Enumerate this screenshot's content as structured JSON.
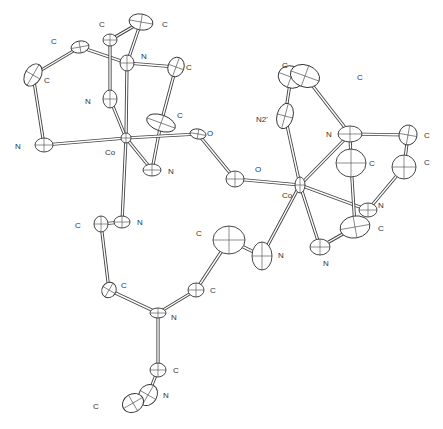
{
  "figure": {
    "type": "ORTEP thermal-ellipsoid diagram"
  },
  "atoms": [
    {
      "id": "c1",
      "el": "C",
      "label": "C",
      "x": 80,
      "y": 47,
      "rx": 9,
      "ry": 6,
      "rot": -10,
      "lx": 51,
      "ly": 44
    },
    {
      "id": "c2",
      "el": "C",
      "label": "C",
      "x": 110,
      "y": 40,
      "rx": 7,
      "ry": 6,
      "rot": 0,
      "lx": 99,
      "ly": 27
    },
    {
      "id": "c3",
      "el": "C",
      "label": "C",
      "x": 141,
      "y": 22,
      "rx": 12,
      "ry": 8,
      "rot": 10,
      "lx": 162,
      "ly": 27
    },
    {
      "id": "c4",
      "el": "C",
      "label": "C",
      "x": 33,
      "y": 75,
      "rx": 8,
      "ry": 12,
      "rot": 30,
      "lx": 44,
      "ly": 83
    },
    {
      "id": "n1",
      "el": "N",
      "label": "N",
      "x": 127,
      "y": 63,
      "rx": 7,
      "ry": 8,
      "rot": 0,
      "lx": 141,
      "ly": 59
    },
    {
      "id": "c5",
      "el": "C",
      "label": "C",
      "x": 176,
      "y": 67,
      "rx": 8,
      "ry": 10,
      "rot": 20,
      "lx": 186,
      "ly": 70
    },
    {
      "id": "n2",
      "el": "N",
      "label": "N",
      "x": 110,
      "y": 99,
      "rx": 7,
      "ry": 9,
      "rot": 0,
      "lx": 85,
      "ly": 104
    },
    {
      "id": "c6",
      "el": "C",
      "label": "C",
      "x": 161,
      "y": 123,
      "rx": 15,
      "ry": 8,
      "rot": 20,
      "lx": 177,
      "ly": 118
    },
    {
      "id": "n3",
      "el": "N",
      "label": "N",
      "x": 44,
      "y": 145,
      "rx": 9,
      "ry": 7,
      "rot": 0,
      "lx": 15,
      "ly": 149
    },
    {
      "id": "co1",
      "el": "Co",
      "label": "Co",
      "x": 126,
      "y": 138,
      "rx": 5,
      "ry": 5,
      "rot": 0,
      "lx": 105,
      "ly": 155
    },
    {
      "id": "o1",
      "el": "O",
      "label": "O",
      "x": 198,
      "y": 134,
      "rx": 8,
      "ry": 5,
      "rot": 10,
      "lx": 207,
      "ly": 136
    },
    {
      "id": "n4",
      "el": "N",
      "label": "N",
      "x": 152,
      "y": 170,
      "rx": 9,
      "ry": 6,
      "rot": 0,
      "lx": 168,
      "ly": 174
    },
    {
      "id": "o2",
      "el": "O",
      "label": "O",
      "x": 235,
      "y": 179,
      "rx": 9,
      "ry": 8,
      "rot": 0,
      "lx": 255,
      "ly": 172
    },
    {
      "id": "c7",
      "el": "C",
      "label": "C",
      "x": 291,
      "y": 77,
      "rx": 13,
      "ry": 11,
      "rot": 20,
      "lx": 282,
      "ly": 68
    },
    {
      "id": "c8",
      "el": "C",
      "label": "C",
      "x": 305,
      "y": 76,
      "rx": 15,
      "ry": 11,
      "rot": 20,
      "lx": 357,
      "ly": 80
    },
    {
      "id": "n5",
      "el": "N",
      "label": "N2'",
      "x": 285,
      "y": 116,
      "rx": 8,
      "ry": 13,
      "rot": 15,
      "lx": 256,
      "ly": 122
    },
    {
      "id": "n6",
      "el": "N",
      "label": "N",
      "x": 350,
      "y": 134,
      "rx": 12,
      "ry": 8,
      "rot": 0,
      "lx": 326,
      "ly": 137
    },
    {
      "id": "c9",
      "el": "C",
      "label": "C",
      "x": 408,
      "y": 135,
      "rx": 9,
      "ry": 10,
      "rot": 10,
      "lx": 424,
      "ly": 138
    },
    {
      "id": "c10",
      "el": "C",
      "label": "C",
      "x": 351,
      "y": 163,
      "rx": 15,
      "ry": 14,
      "rot": 0,
      "lx": 369,
      "ly": 166
    },
    {
      "id": "c11",
      "el": "C",
      "label": "C",
      "x": 404,
      "y": 167,
      "rx": 12,
      "ry": 12,
      "rot": 0,
      "lx": 424,
      "ly": 165
    },
    {
      "id": "co2",
      "el": "Co",
      "label": "Co",
      "x": 300,
      "y": 185,
      "rx": 5,
      "ry": 8,
      "rot": 0,
      "lx": 282,
      "ly": 198
    },
    {
      "id": "n7",
      "el": "N",
      "label": "N",
      "x": 368,
      "y": 210,
      "rx": 9,
      "ry": 7,
      "rot": 0,
      "lx": 378,
      "ly": 208
    },
    {
      "id": "c12",
      "el": "C",
      "label": "C",
      "x": 355,
      "y": 227,
      "rx": 15,
      "ry": 11,
      "rot": -10,
      "lx": 378,
      "ly": 231
    },
    {
      "id": "n8",
      "el": "N",
      "label": "N",
      "x": 320,
      "y": 247,
      "rx": 10,
      "ry": 8,
      "rot": 0,
      "lx": 323,
      "ly": 266
    },
    {
      "id": "n9",
      "el": "N",
      "label": "N",
      "x": 262,
      "y": 256,
      "rx": 10,
      "ry": 14,
      "rot": 0,
      "lx": 278,
      "ly": 258
    },
    {
      "id": "c13",
      "el": "C",
      "label": "C",
      "x": 229,
      "y": 240,
      "rx": 16,
      "ry": 14,
      "rot": 0,
      "lx": 196,
      "ly": 236
    },
    {
      "id": "c14",
      "el": "C",
      "label": "C",
      "x": 101,
      "y": 224,
      "rx": 7,
      "ry": 8,
      "rot": 0,
      "lx": 75,
      "ly": 228
    },
    {
      "id": "n10",
      "el": "N",
      "label": "N",
      "x": 122,
      "y": 222,
      "rx": 8,
      "ry": 6,
      "rot": 0,
      "lx": 137,
      "ly": 225
    },
    {
      "id": "c15",
      "el": "C",
      "label": "C",
      "x": 109,
      "y": 290,
      "rx": 7,
      "ry": 8,
      "rot": 30,
      "lx": 121,
      "ly": 288
    },
    {
      "id": "n11",
      "el": "N",
      "label": "N",
      "x": 158,
      "y": 313,
      "rx": 8,
      "ry": 5,
      "rot": 0,
      "lx": 171,
      "ly": 320
    },
    {
      "id": "c16",
      "el": "C",
      "label": "C",
      "x": 196,
      "y": 290,
      "rx": 8,
      "ry": 7,
      "rot": 0,
      "lx": 210,
      "ly": 293
    },
    {
      "id": "c17",
      "el": "C",
      "label": "C",
      "x": 158,
      "y": 370,
      "rx": 8,
      "ry": 7,
      "rot": 0,
      "lx": 173,
      "ly": 373
    },
    {
      "id": "n12",
      "el": "N",
      "label": "N",
      "x": 148,
      "y": 395,
      "rx": 9,
      "ry": 11,
      "rot": 30,
      "lx": 163,
      "ly": 398
    },
    {
      "id": "c18",
      "el": "C",
      "label": "C",
      "x": 133,
      "y": 403,
      "rx": 9,
      "ry": 11,
      "rot": 60,
      "lx": 93,
      "ly": 409
    }
  ],
  "bonds": [
    [
      "c1",
      "c4"
    ],
    [
      "c1",
      "n1"
    ],
    [
      "c4",
      "n3"
    ],
    [
      "n3",
      "co1"
    ],
    [
      "c2",
      "c3"
    ],
    [
      "c3",
      "n1"
    ],
    [
      "c2",
      "n2"
    ],
    [
      "n1",
      "c5"
    ],
    [
      "n1",
      "co1"
    ],
    [
      "n2",
      "co1"
    ],
    [
      "c5",
      "c6"
    ],
    [
      "c6",
      "n4"
    ],
    [
      "n4",
      "co1"
    ],
    [
      "co1",
      "o1"
    ],
    [
      "o1",
      "o2"
    ],
    [
      "o2",
      "co2"
    ],
    [
      "co1",
      "n10"
    ],
    [
      "n10",
      "c14"
    ],
    [
      "c14",
      "c15"
    ],
    [
      "c15",
      "n11"
    ],
    [
      "n11",
      "c16"
    ],
    [
      "c16",
      "c13"
    ],
    [
      "c13",
      "n9"
    ],
    [
      "n9",
      "co2"
    ],
    [
      "n11",
      "c17"
    ],
    [
      "c17",
      "n12"
    ],
    [
      "n12",
      "c18"
    ],
    [
      "co2",
      "n5"
    ],
    [
      "n5",
      "c7"
    ],
    [
      "c8",
      "n6"
    ],
    [
      "n6",
      "co2"
    ],
    [
      "n6",
      "c9"
    ],
    [
      "c9",
      "c11"
    ],
    [
      "c11",
      "n7"
    ],
    [
      "n7",
      "co2"
    ],
    [
      "co2",
      "n8"
    ],
    [
      "n8",
      "c12"
    ],
    [
      "c12",
      "c10"
    ],
    [
      "c10",
      "n6"
    ]
  ]
}
